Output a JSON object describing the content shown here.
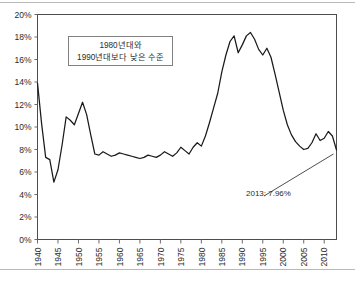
{
  "chart_data": {
    "type": "line",
    "title": "",
    "subtitle": "",
    "xlabel": "",
    "ylabel": "",
    "xlim": [
      1940,
      2013
    ],
    "ylim": [
      0,
      20
    ],
    "grid": false,
    "legend_position": "none",
    "y_tick_labels": [
      "20%",
      "18%",
      "16%",
      "14%",
      "12%",
      "10%",
      "8%",
      "6%",
      "4%",
      "2%",
      "0%"
    ],
    "y_tick_values": [
      20,
      18,
      16,
      14,
      12,
      10,
      8,
      6,
      4,
      2,
      0
    ],
    "x_tick_labels": [
      "1940",
      "1945",
      "1950",
      "1955",
      "1960",
      "1965",
      "1970",
      "1975",
      "1980",
      "1985",
      "1990",
      "1995",
      "2000",
      "2005",
      "2010"
    ],
    "x_tick_values": [
      1940,
      1945,
      1950,
      1955,
      1960,
      1965,
      1970,
      1975,
      1980,
      1985,
      1990,
      1995,
      2000,
      2005,
      2010
    ],
    "series": [
      {
        "name": "rate",
        "color": "#1a1a1a",
        "x": [
          1940,
          1941,
          1942,
          1943,
          1944,
          1945,
          1946,
          1947,
          1948,
          1949,
          1950,
          1951,
          1952,
          1953,
          1954,
          1955,
          1956,
          1957,
          1958,
          1959,
          1960,
          1961,
          1962,
          1963,
          1964,
          1965,
          1966,
          1967,
          1968,
          1969,
          1970,
          1971,
          1972,
          1973,
          1974,
          1975,
          1976,
          1977,
          1978,
          1979,
          1980,
          1981,
          1982,
          1983,
          1984,
          1985,
          1986,
          1987,
          1988,
          1989,
          1990,
          1991,
          1992,
          1993,
          1994,
          1995,
          1996,
          1997,
          1998,
          1999,
          2000,
          2001,
          2002,
          2003,
          2004,
          2005,
          2006,
          2007,
          2008,
          2009,
          2010,
          2011,
          2012,
          2013
        ],
        "y": [
          13.9,
          10.3,
          7.3,
          7.1,
          5.1,
          6.2,
          8.4,
          10.9,
          10.6,
          10.2,
          11.2,
          12.2,
          11.1,
          9.3,
          7.6,
          7.5,
          7.8,
          7.6,
          7.4,
          7.5,
          7.7,
          7.6,
          7.5,
          7.4,
          7.3,
          7.2,
          7.3,
          7.5,
          7.4,
          7.3,
          7.5,
          7.8,
          7.6,
          7.4,
          7.7,
          8.2,
          7.9,
          7.6,
          8.2,
          8.6,
          8.3,
          9.2,
          10.4,
          11.7,
          13.0,
          14.9,
          16.4,
          17.6,
          18.1,
          16.6,
          17.3,
          18.1,
          18.4,
          17.8,
          16.9,
          16.4,
          17.0,
          16.2,
          14.7,
          13.1,
          11.5,
          10.2,
          9.3,
          8.7,
          8.3,
          8.0,
          8.1,
          8.6,
          9.4,
          8.8,
          9.0,
          9.6,
          9.2,
          7.96
        ]
      }
    ],
    "annotations": [
      {
        "name": "callout-box",
        "lines": [
          "1980년대와",
          "1990년대보다 낮은 수준"
        ]
      },
      {
        "name": "endpoint-label",
        "text": "2013: 7.96%",
        "x": 2013,
        "y": 7.96
      }
    ]
  }
}
